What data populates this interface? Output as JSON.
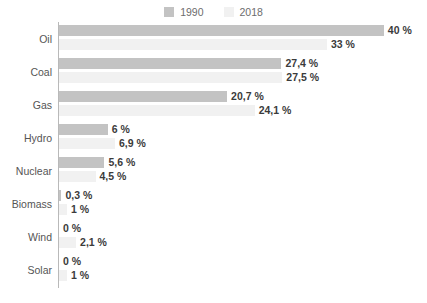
{
  "chart_data": {
    "type": "bar",
    "orientation": "horizontal",
    "title": "",
    "subtitle": "",
    "xlabel": "",
    "ylabel": "",
    "grid": false,
    "legend_position": "top-center",
    "xlim": [
      0,
      40
    ],
    "unit": "%",
    "categories": [
      "Oil",
      "Coal",
      "Gas",
      "Hydro",
      "Nuclear",
      "Biomass",
      "Wind",
      "Solar"
    ],
    "series": [
      {
        "name": "1990",
        "color": "#c3c3c3",
        "values": [
          40,
          27.4,
          20.7,
          6,
          5.6,
          0.3,
          0,
          0
        ],
        "labels": [
          "40 %",
          "27,4 %",
          "20,7 %",
          "6 %",
          "5,6 %",
          "0,3 %",
          "0 %",
          "0 %"
        ]
      },
      {
        "name": "2018",
        "color": "#f1f1f1",
        "values": [
          33,
          27.5,
          24.1,
          6.9,
          4.5,
          1,
          2.1,
          1
        ],
        "labels": [
          "33 %",
          "27,5 %",
          "24,1 %",
          "6,9 %",
          "4,5 %",
          "1 %",
          "2,1 %",
          "1 %"
        ]
      }
    ]
  },
  "legend": {
    "items": [
      {
        "label": "1990",
        "color": "#c3c3c3"
      },
      {
        "label": "2018",
        "color": "#f1f1f1"
      }
    ]
  },
  "axis": {
    "line_color": "#b9b9b9"
  }
}
